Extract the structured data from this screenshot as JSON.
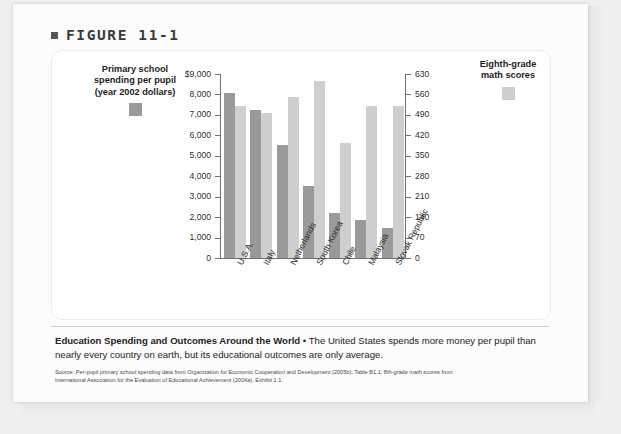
{
  "figure": {
    "bullet_icon": "square-bullet-icon",
    "label": "FIGURE 11-1"
  },
  "legends": {
    "left": {
      "title": "Primary school\nspending per pupil\n(year 2002 dollars)",
      "color": "#9a9a9a",
      "swatch_icon": "legend-swatch-icon"
    },
    "right": {
      "title": "Eighth-grade\nmath scores",
      "color": "#cfcfcf",
      "swatch_icon": "legend-swatch-icon"
    }
  },
  "caption": {
    "headline": "Education Spending and Outcomes Around the World",
    "separator": " • ",
    "body": "The United States spends more money per pupil than nearly every country on earth, but its educational outcomes are only average."
  },
  "source": {
    "line1": "Source: Per-pupil primary school spending data from Organization for Economic Cooperation and Development (2005b), Table B1.1; 8th-grade math scores from",
    "line2": "International Association for the Evaluation of Educational Achievement (2004a), Exhibit 1.1."
  },
  "chart_data": {
    "type": "bar",
    "title": "Education Spending and Outcomes Around the World",
    "xlabel": "",
    "categories": [
      "U.S.A.",
      "Italy",
      "Netherlands",
      "South Korea",
      "Chile",
      "Malaysia",
      "Slovak Republic"
    ],
    "series": [
      {
        "name": "Primary school spending per pupil (year 2002 dollars)",
        "axis": "left",
        "color": "#9a9a9a",
        "values": [
          8050,
          7230,
          5530,
          3540,
          2190,
          1870,
          1450
        ]
      },
      {
        "name": "Eighth-grade math scores",
        "axis": "right",
        "color": "#cfcfcf",
        "values": [
          519,
          498,
          551,
          605,
          395,
          521,
          522
        ]
      }
    ],
    "left_axis": {
      "label": "",
      "ylim": [
        0,
        9000
      ],
      "ticks": [
        0,
        1000,
        2000,
        3000,
        4000,
        5000,
        6000,
        7000,
        8000,
        9000
      ],
      "tick_labels": [
        "0",
        "1,000",
        "2,000",
        "3,000",
        "4,000",
        "5,000",
        "6,000",
        "7,000",
        "8,000",
        "$9,000"
      ]
    },
    "right_axis": {
      "label": "",
      "ylim": [
        0,
        630
      ],
      "ticks": [
        0,
        70,
        140,
        210,
        280,
        350,
        420,
        490,
        560,
        630
      ],
      "tick_labels": [
        "0",
        "70",
        "140",
        "210",
        "280",
        "350",
        "420",
        "490",
        "560",
        "630"
      ]
    },
    "grid": false,
    "legend_position": "outside-top-left-and-top-right"
  }
}
